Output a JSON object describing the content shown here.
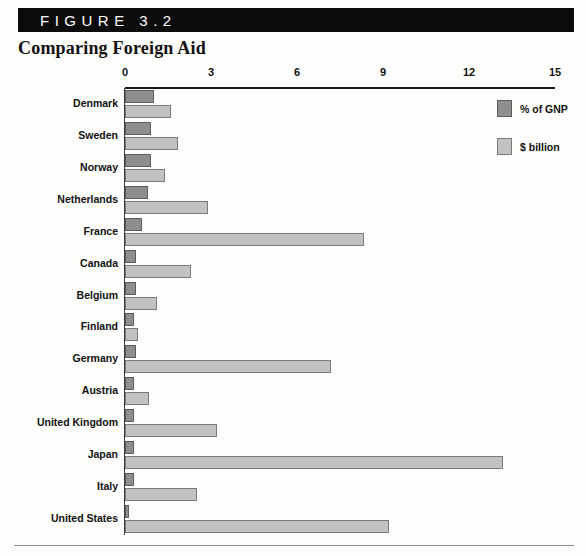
{
  "figure": {
    "bar_label": "FIGURE 3.2",
    "title": "Comparing Foreign Aid"
  },
  "legend": {
    "items": [
      {
        "label": "% of GNP",
        "color": "#8e8e8e",
        "key": "gnp"
      },
      {
        "label": "$ billion",
        "color": "#c2c2c2",
        "key": "billion"
      }
    ]
  },
  "axis": {
    "ticks": [
      "0",
      "3",
      "6",
      "9",
      "12",
      "15"
    ],
    "min": 0,
    "max": 15
  },
  "chart_data": {
    "type": "bar",
    "orientation": "horizontal",
    "title": "Comparing Foreign Aid",
    "xlabel": "",
    "ylabel": "",
    "xlim": [
      0,
      15
    ],
    "grid": false,
    "legend_position": "top-right",
    "categories": [
      "Denmark",
      "Sweden",
      "Norway",
      "Netherlands",
      "France",
      "Canada",
      "Belgium",
      "Finland",
      "Germany",
      "Austria",
      "United Kingdom",
      "Japan",
      "Italy",
      "United States"
    ],
    "series": [
      {
        "name": "% of GNP",
        "color": "#8e8e8e",
        "values": [
          1.0,
          0.9,
          0.9,
          0.8,
          0.6,
          0.4,
          0.4,
          0.3,
          0.4,
          0.33,
          0.3,
          0.3,
          0.3,
          0.15
        ]
      },
      {
        "name": "$ billion",
        "color": "#c2c2c2",
        "values": [
          1.6,
          1.85,
          1.4,
          2.9,
          8.35,
          2.3,
          1.1,
          0.45,
          7.2,
          0.85,
          3.2,
          13.2,
          2.5,
          9.2
        ]
      }
    ]
  }
}
